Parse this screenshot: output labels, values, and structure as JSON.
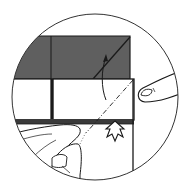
{
  "figure": {
    "type": "origami-instruction-inset",
    "colors": {
      "background": "#ffffff",
      "ink": "#1a1a1a",
      "paper_colored_side": "#5f5f5f",
      "paper_white_side": "#ffffff"
    },
    "symbols": [
      {
        "name": "valley-fold-line",
        "style": "dash-dot"
      },
      {
        "name": "fold-up-arrow",
        "style": "curved arrow"
      },
      {
        "name": "push-arrow",
        "style": "hollow notched arrow"
      }
    ]
  }
}
